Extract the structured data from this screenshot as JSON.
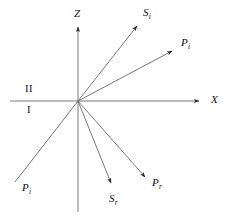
{
  "figure": {
    "background_color": "#ffffff",
    "line_color": "#6a6a6a",
    "text_color": "#111111",
    "width": 230,
    "height": 218
  },
  "axes": {
    "origin": {
      "x": 78,
      "y": 101
    },
    "vertical": {
      "name": "Z",
      "label": "Z",
      "x": 78,
      "y_top": 22,
      "y_bottom": 212,
      "arrow_at": "top"
    },
    "horizontal": {
      "name": "X",
      "label": "X",
      "y": 101,
      "x_left": 10,
      "x_right": 205,
      "arrow_at": "right"
    }
  },
  "regions": [
    {
      "name": "region-upper",
      "label": "II",
      "x": 25,
      "y": 84
    },
    {
      "name": "region-lower",
      "label": "I",
      "x": 27,
      "y": 105
    }
  ],
  "rays": [
    {
      "name": "incident-p-wave",
      "label": "P",
      "subscript": "i",
      "from": {
        "x": 15,
        "y": 182
      },
      "to": {
        "x": 78,
        "y": 101
      },
      "arrowhead": false,
      "label_pos": {
        "x": 22,
        "y": 182
      }
    },
    {
      "name": "transmitted-s-wave",
      "label": "S",
      "subscript": "i",
      "from": {
        "x": 78,
        "y": 101
      },
      "to": {
        "x": 141,
        "y": 21
      },
      "arrowhead": true,
      "label_pos": {
        "x": 143,
        "y": 7
      }
    },
    {
      "name": "transmitted-p-wave",
      "label": "P",
      "subscript": "i",
      "from": {
        "x": 78,
        "y": 101
      },
      "to": {
        "x": 177,
        "y": 48
      },
      "arrowhead": true,
      "label_pos": {
        "x": 181,
        "y": 37
      }
    },
    {
      "name": "reflected-s-wave",
      "label": "S",
      "subscript": "r",
      "from": {
        "x": 78,
        "y": 101
      },
      "to": {
        "x": 113,
        "y": 189
      },
      "arrowhead": true,
      "label_pos": {
        "x": 109,
        "y": 193
      }
    },
    {
      "name": "reflected-p-wave",
      "label": "P",
      "subscript": "r",
      "from": {
        "x": 78,
        "y": 101
      },
      "to": {
        "x": 149,
        "y": 182
      },
      "arrowhead": true,
      "label_pos": {
        "x": 152,
        "y": 177
      }
    }
  ],
  "labels": {
    "z_axis": "Z",
    "x_axis": "X",
    "region_upper": "II",
    "region_lower": "I",
    "s_incident": "S",
    "s_incident_sub": "i",
    "p_transmitted": "P",
    "p_transmitted_sub": "i",
    "p_incident": "P",
    "p_incident_sub": "i",
    "s_reflected": "S",
    "s_reflected_sub": "r",
    "p_reflected": "P",
    "p_reflected_sub": "r"
  }
}
